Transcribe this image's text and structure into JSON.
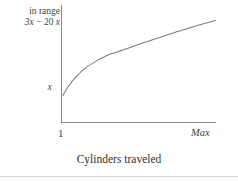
{
  "figure": {
    "caption": "Cylinders traveled"
  },
  "axes": {
    "y_label_line1": "in range",
    "y_label_line2_prefix": "3x",
    "y_label_line2_minus": "−",
    "y_label_line2_suffix": "20",
    "y_label_line2_var": "x",
    "y_label_line2_full": "3x − 20 x",
    "y_tick_label": "x",
    "x_tick_min": "1",
    "x_tick_max": "Max"
  },
  "colors": {
    "axis": "#8a8a8a",
    "curve": "#7b7b7b",
    "text": "#3f3f3f",
    "rule": "#d8d8d8",
    "background": "#ffffff"
  },
  "chart_data": {
    "type": "line",
    "title": "",
    "subtitle": "",
    "xlabel": "Cylinders traveled",
    "ylabel": "3x − 20 x in range",
    "grid": false,
    "legend": null,
    "x_tick_labels": [
      "1",
      "Max"
    ],
    "y_tick_labels": [
      "x"
    ],
    "xlim": [
      0,
      100
    ],
    "ylim": [
      0,
      100
    ],
    "annotations": [
      {
        "text": "in range",
        "position": "y-axis-top-left"
      },
      {
        "text": "3x − 20 x",
        "position": "y-axis-top-left"
      },
      {
        "text": "x",
        "position": "y-axis-tick"
      },
      {
        "text": "1",
        "position": "x-axis-left"
      },
      {
        "text": "Max",
        "position": "x-axis-right"
      }
    ],
    "series": [
      {
        "name": "seek time",
        "shape": "concave-increasing",
        "x": [
          0.6,
          4,
          9,
          16,
          24,
          31,
          36,
          44,
          54,
          65,
          78,
          90,
          100
        ],
        "y": [
          25,
          33,
          42,
          51,
          58,
          63,
          65,
          69,
          74,
          79,
          85,
          90,
          94
        ]
      }
    ]
  }
}
